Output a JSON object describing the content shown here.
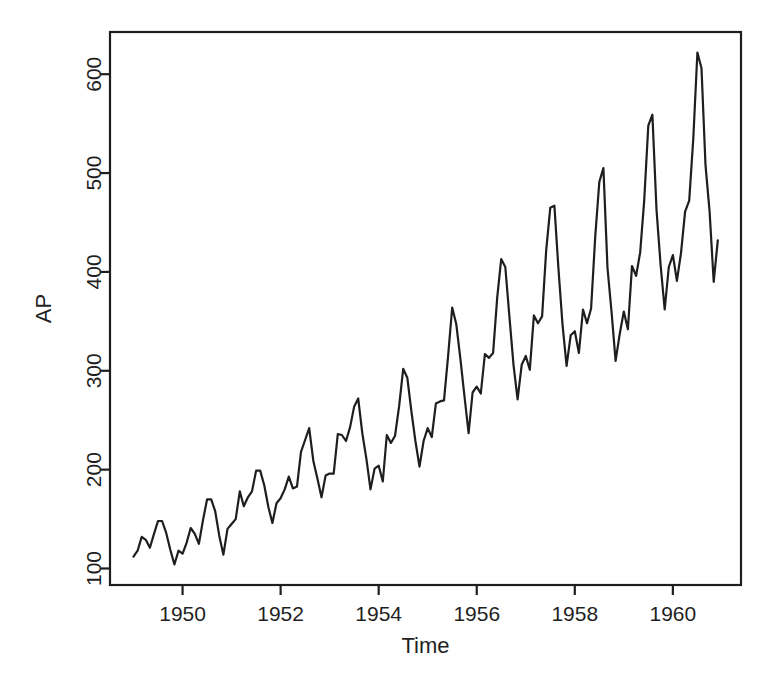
{
  "figure": {
    "background": "#ffffff",
    "ink": "#1e1e1e"
  },
  "chart_data": {
    "type": "line",
    "title": "",
    "xlabel": "Time",
    "ylabel": "AP",
    "grid": false,
    "legend": "none",
    "line_color": "#1e1e1e",
    "axis_color": "#1e1e1e",
    "line_width": 2.2,
    "xlim": [
      1948.52,
      1961.39
    ],
    "ylim": [
      83.3,
      642.7
    ],
    "x_ticks": [
      1950,
      1952,
      1954,
      1956,
      1958,
      1960
    ],
    "y_ticks": [
      100,
      200,
      300,
      400,
      500,
      600
    ],
    "series": [
      {
        "name": "AP",
        "start_year": 1949,
        "frequency": 12,
        "values": [
          112,
          118,
          132,
          129,
          121,
          135,
          148,
          148,
          136,
          119,
          104,
          118,
          115,
          126,
          141,
          135,
          125,
          149,
          170,
          170,
          158,
          133,
          114,
          140,
          145,
          150,
          178,
          163,
          172,
          178,
          199,
          199,
          184,
          162,
          146,
          166,
          171,
          180,
          193,
          181,
          183,
          218,
          230,
          242,
          209,
          191,
          172,
          194,
          196,
          196,
          236,
          235,
          229,
          243,
          264,
          272,
          237,
          211,
          180,
          201,
          204,
          188,
          235,
          227,
          234,
          264,
          302,
          293,
          259,
          229,
          203,
          229,
          242,
          233,
          267,
          269,
          270,
          315,
          364,
          347,
          312,
          274,
          237,
          278,
          284,
          277,
          317,
          313,
          318,
          374,
          413,
          405,
          355,
          306,
          271,
          306,
          315,
          301,
          356,
          348,
          355,
          422,
          465,
          467,
          404,
          347,
          305,
          336,
          340,
          318,
          362,
          348,
          363,
          435,
          491,
          505,
          404,
          359,
          310,
          337,
          360,
          342,
          406,
          396,
          420,
          472,
          548,
          559,
          463,
          407,
          362,
          405,
          417,
          391,
          419,
          461,
          472,
          535,
          622,
          606,
          508,
          461,
          390,
          432
        ]
      }
    ]
  }
}
